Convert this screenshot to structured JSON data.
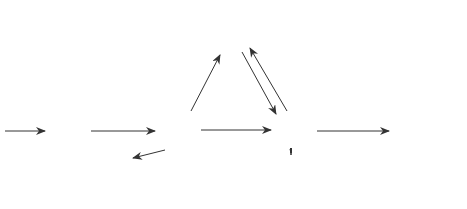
{
  "diagram": {
    "type": "state-transition-graph",
    "nodes": [
      {
        "id": "1",
        "label": "1"
      },
      {
        "id": "2",
        "label": "2"
      },
      {
        "id": "3",
        "label": "3"
      },
      {
        "id": "4",
        "label": "4"
      },
      {
        "id": "5",
        "label": "5"
      },
      {
        "id": "6",
        "label": "6"
      }
    ],
    "edges": [
      {
        "from": "in",
        "to": "1",
        "label": ""
      },
      {
        "from": "1",
        "to": "2",
        "label": "1"
      },
      {
        "from": "2",
        "to": "5",
        "label": "0.025"
      },
      {
        "from": "2",
        "to": "3",
        "label": "0.97"
      },
      {
        "from": "2",
        "to": "6",
        "label": "0.005"
      },
      {
        "from": "5",
        "to": "3",
        "label": "1"
      },
      {
        "from": "3",
        "to": "5",
        "label": "0.008"
      },
      {
        "from": "3",
        "to": "4",
        "label": "0.99"
      },
      {
        "from": "3",
        "to": "6",
        "label": "0.002"
      },
      {
        "from": "6",
        "to": "1",
        "label": "1"
      },
      {
        "from": "4",
        "to": "out",
        "label": ""
      }
    ]
  }
}
